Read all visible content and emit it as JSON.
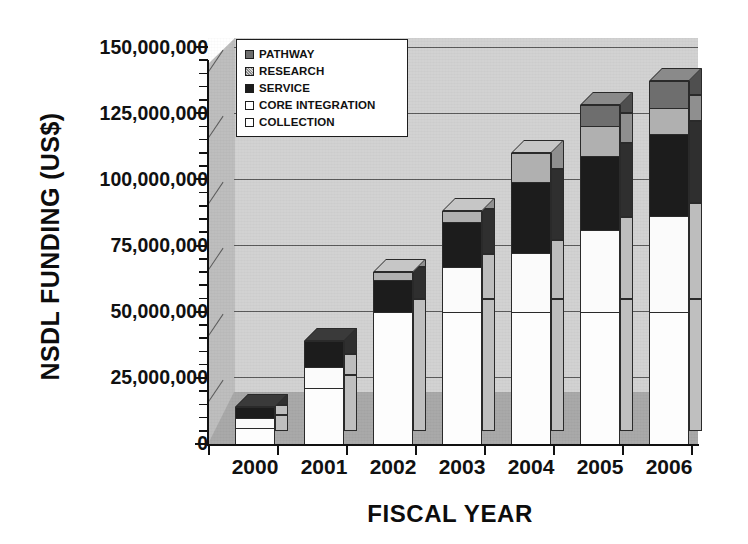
{
  "chart_data": {
    "type": "bar",
    "subtype": "stacked-column-3d",
    "title": "",
    "xlabel": "FISCAL YEAR",
    "ylabel": "NSDL FUNDING (US$)",
    "categories": [
      "2000",
      "2001",
      "2002",
      "2003",
      "2004",
      "2005",
      "2006"
    ],
    "ylim": [
      0,
      150000000
    ],
    "ytick_values": [
      0,
      25000000,
      50000000,
      75000000,
      100000000,
      125000000,
      150000000
    ],
    "ytick_labels": [
      "0",
      "25,000,000",
      "50,000,000",
      "75,000,000",
      "100,000,000",
      "125,000,000",
      "150,000,000"
    ],
    "grid": true,
    "grid_axis": "y",
    "legend_position": "upper-left-inside",
    "stack_order_bottom_to_top": [
      "COLLECTION",
      "CORE INTEGRATION",
      "SERVICE",
      "RESEARCH",
      "PATHWAY"
    ],
    "series": [
      {
        "name": "COLLECTION",
        "color": "#fdfdfd",
        "values": [
          6000000,
          21000000,
          50000000,
          50000000,
          50000000,
          50000000,
          50000000
        ]
      },
      {
        "name": "CORE INTEGRATION",
        "color": "#fbfbfb",
        "values": [
          4000000,
          8000000,
          0,
          17000000,
          22000000,
          31000000,
          36000000
        ]
      },
      {
        "name": "SERVICE",
        "color": "#1c1c1c",
        "values": [
          4000000,
          10000000,
          12000000,
          17000000,
          27000000,
          28000000,
          31000000
        ]
      },
      {
        "name": "RESEARCH",
        "color": "#b0b0b0",
        "values": [
          0,
          0,
          3000000,
          4000000,
          11000000,
          11000000,
          10000000
        ]
      },
      {
        "name": "PATHWAY",
        "color": "#6e6e6e",
        "values": [
          0,
          0,
          0,
          0,
          0,
          8000000,
          10000000
        ]
      }
    ],
    "totals": [
      14000000,
      39000000,
      65000000,
      88000000,
      110000000,
      128000000,
      137000000
    ]
  },
  "legend": {
    "items": [
      {
        "label": "PATHWAY",
        "swatch": "pathway-swatch"
      },
      {
        "label": "RESEARCH",
        "swatch": "research-swatch"
      },
      {
        "label": "SERVICE",
        "swatch": "service-swatch"
      },
      {
        "label": "CORE INTEGRATION",
        "swatch": "core-integration-swatch"
      },
      {
        "label": "COLLECTION",
        "swatch": "collection-swatch"
      }
    ]
  },
  "axes": {
    "y_title": "NSDL FUNDING (US$)",
    "x_title": "FISCAL YEAR",
    "y_labels": [
      "150,000,000",
      "125,000,000",
      "100,000,000",
      "75,000,000",
      "50,000,000",
      "25,000,000",
      "0"
    ],
    "x_labels": [
      "2000",
      "2001",
      "2002",
      "2003",
      "2004",
      "2005",
      "2006"
    ]
  },
  "colors": {
    "pathway": "#6e6e6e",
    "research": "#b0b0b0",
    "service": "#1c1c1c",
    "core_integration": "#fbfbfb",
    "collection": "#fdfdfd",
    "plot_background": "#d2d2d2",
    "floor": "#a8a8a8",
    "axis": "#111111"
  }
}
